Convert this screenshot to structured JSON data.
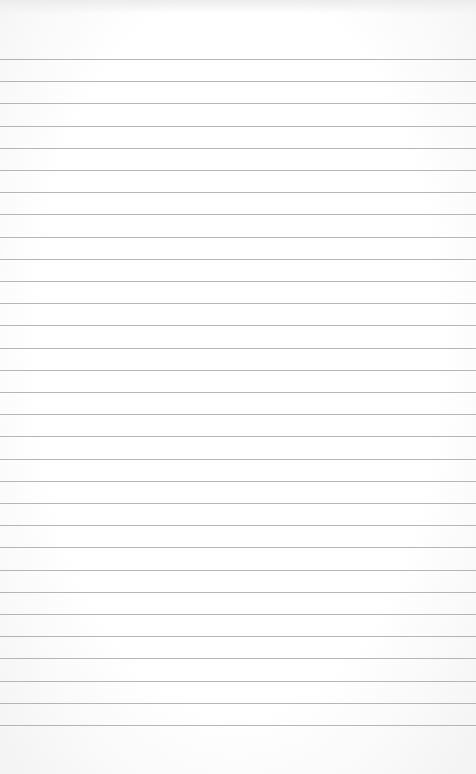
{
  "page": {
    "type": "lined-notepad-page",
    "background_color": "#ffffff",
    "line_color": "#a9a9a9",
    "line_count": 31,
    "first_line_y": 59,
    "line_spacing": 22.2,
    "text_content": ""
  }
}
